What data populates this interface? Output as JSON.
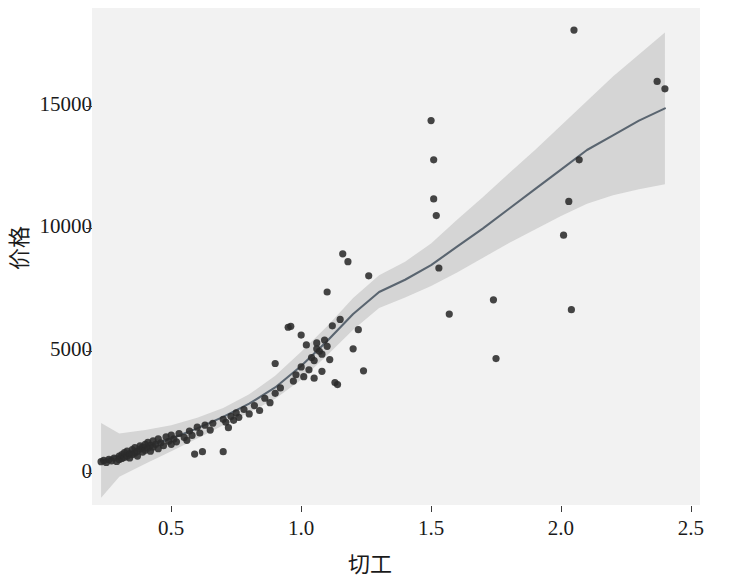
{
  "chart_data": {
    "type": "scatter",
    "title": "",
    "subtitle": "",
    "xlabel": "切工",
    "ylabel": "价格",
    "xlim": [
      0.195,
      2.535
    ],
    "ylim": [
      -1300,
      19000
    ],
    "xticks": [
      0.5,
      1.0,
      1.5,
      2.0,
      2.5
    ],
    "xtick_labels": [
      "0.5",
      "1.0",
      "1.5",
      "2.0",
      "2.5"
    ],
    "yticks": [
      0,
      5000,
      10000,
      15000
    ],
    "ytick_labels": [
      "0",
      "5000",
      "10000",
      "15000"
    ],
    "grid": false,
    "legend": "none",
    "panel_background": "#f2f2f2",
    "point_color": "#2b2b2b",
    "line_color": "#5a6570",
    "band_color": "#c9c9c9",
    "smoother": "loess",
    "confidence_level": 0.95,
    "series": [
      {
        "name": "观测点",
        "marker": "circle",
        "color": "#2b2b2b",
        "points": [
          [
            0.23,
            470
          ],
          [
            0.24,
            520
          ],
          [
            0.25,
            440
          ],
          [
            0.26,
            560
          ],
          [
            0.27,
            500
          ],
          [
            0.28,
            620
          ],
          [
            0.29,
            480
          ],
          [
            0.3,
            560
          ],
          [
            0.3,
            700
          ],
          [
            0.31,
            600
          ],
          [
            0.31,
            760
          ],
          [
            0.32,
            640
          ],
          [
            0.32,
            840
          ],
          [
            0.33,
            700
          ],
          [
            0.33,
            900
          ],
          [
            0.34,
            620
          ],
          [
            0.34,
            800
          ],
          [
            0.35,
            760
          ],
          [
            0.35,
            960
          ],
          [
            0.36,
            820
          ],
          [
            0.36,
            1040
          ],
          [
            0.37,
            700
          ],
          [
            0.37,
            900
          ],
          [
            0.38,
            980
          ],
          [
            0.38,
            1120
          ],
          [
            0.39,
            860
          ],
          [
            0.39,
            1060
          ],
          [
            0.4,
            940
          ],
          [
            0.4,
            1180
          ],
          [
            0.41,
            1020
          ],
          [
            0.41,
            1260
          ],
          [
            0.42,
            900
          ],
          [
            0.42,
            1140
          ],
          [
            0.43,
            1060
          ],
          [
            0.43,
            1320
          ],
          [
            0.44,
            1180
          ],
          [
            0.45,
            1000
          ],
          [
            0.45,
            1400
          ],
          [
            0.46,
            1240
          ],
          [
            0.47,
            1120
          ],
          [
            0.48,
            1480
          ],
          [
            0.49,
            1300
          ],
          [
            0.5,
            1180
          ],
          [
            0.5,
            1560
          ],
          [
            0.51,
            1400
          ],
          [
            0.52,
            1280
          ],
          [
            0.53,
            1620
          ],
          [
            0.55,
            1460
          ],
          [
            0.56,
            1340
          ],
          [
            0.57,
            1720
          ],
          [
            0.58,
            1540
          ],
          [
            0.59,
            780
          ],
          [
            0.6,
            1880
          ],
          [
            0.61,
            1640
          ],
          [
            0.62,
            880
          ],
          [
            0.63,
            1960
          ],
          [
            0.65,
            1760
          ],
          [
            0.66,
            2040
          ],
          [
            0.7,
            880
          ],
          [
            0.7,
            2200
          ],
          [
            0.71,
            2080
          ],
          [
            0.72,
            1860
          ],
          [
            0.73,
            2320
          ],
          [
            0.74,
            2160
          ],
          [
            0.75,
            2460
          ],
          [
            0.76,
            2280
          ],
          [
            0.78,
            2600
          ],
          [
            0.8,
            2420
          ],
          [
            0.82,
            2760
          ],
          [
            0.84,
            2560
          ],
          [
            0.86,
            3060
          ],
          [
            0.88,
            2880
          ],
          [
            0.9,
            4480
          ],
          [
            0.9,
            3260
          ],
          [
            0.92,
            3480
          ],
          [
            0.95,
            5960
          ],
          [
            0.96,
            6000
          ],
          [
            0.97,
            3760
          ],
          [
            0.98,
            4020
          ],
          [
            1.0,
            5640
          ],
          [
            1.0,
            4340
          ],
          [
            1.01,
            3940
          ],
          [
            1.02,
            5240
          ],
          [
            1.03,
            4220
          ],
          [
            1.04,
            4720
          ],
          [
            1.05,
            3880
          ],
          [
            1.05,
            4600
          ],
          [
            1.06,
            5080
          ],
          [
            1.06,
            5320
          ],
          [
            1.07,
            4980
          ],
          [
            1.08,
            4860
          ],
          [
            1.08,
            4160
          ],
          [
            1.09,
            5440
          ],
          [
            1.1,
            7400
          ],
          [
            1.1,
            5180
          ],
          [
            1.11,
            4640
          ],
          [
            1.12,
            6020
          ],
          [
            1.13,
            3700
          ],
          [
            1.14,
            3620
          ],
          [
            1.15,
            6280
          ],
          [
            1.16,
            8960
          ],
          [
            1.18,
            8640
          ],
          [
            1.2,
            5080
          ],
          [
            1.22,
            5860
          ],
          [
            1.24,
            4180
          ],
          [
            1.26,
            8060
          ],
          [
            1.5,
            14400
          ],
          [
            1.51,
            12800
          ],
          [
            1.51,
            11200
          ],
          [
            1.52,
            10520
          ],
          [
            1.53,
            8380
          ],
          [
            1.57,
            6500
          ],
          [
            1.74,
            7080
          ],
          [
            1.75,
            4680
          ],
          [
            2.01,
            9720
          ],
          [
            2.03,
            11100
          ],
          [
            2.04,
            6680
          ],
          [
            2.05,
            18100
          ],
          [
            2.07,
            12800
          ],
          [
            2.37,
            16000
          ],
          [
            2.4,
            15700
          ]
        ]
      }
    ],
    "fit_line": {
      "name": "loess 平滑曲线",
      "color": "#5a6570",
      "x": [
        0.23,
        0.3,
        0.4,
        0.5,
        0.6,
        0.7,
        0.8,
        0.9,
        1.0,
        1.1,
        1.2,
        1.3,
        1.4,
        1.5,
        1.6,
        1.7,
        1.8,
        1.9,
        2.0,
        2.1,
        2.2,
        2.3,
        2.4
      ],
      "y": [
        520,
        720,
        1060,
        1420,
        1830,
        2300,
        2840,
        3500,
        4380,
        5400,
        6500,
        7400,
        7900,
        8500,
        9250,
        10000,
        10800,
        11600,
        12400,
        13200,
        13800,
        14400,
        14900
      ]
    },
    "confidence_band": {
      "color": "#c9c9c9",
      "x": [
        0.23,
        0.3,
        0.4,
        0.5,
        0.6,
        0.7,
        0.8,
        0.9,
        1.0,
        1.1,
        1.2,
        1.3,
        1.4,
        1.5,
        1.6,
        1.7,
        1.8,
        1.9,
        2.0,
        2.1,
        2.2,
        2.3,
        2.4
      ],
      "lower": [
        -1000,
        -150,
        380,
        900,
        1420,
        1960,
        2480,
        3040,
        3820,
        4820,
        5860,
        6750,
        7180,
        7650,
        8200,
        8800,
        9400,
        9950,
        10500,
        11000,
        11350,
        11600,
        11800
      ],
      "upper": [
        2050,
        1620,
        1760,
        1960,
        2260,
        2660,
        3220,
        3980,
        4960,
        6000,
        7160,
        8080,
        8640,
        9380,
        10350,
        11280,
        12250,
        13200,
        14200,
        15200,
        16200,
        17100,
        18000
      ]
    }
  }
}
